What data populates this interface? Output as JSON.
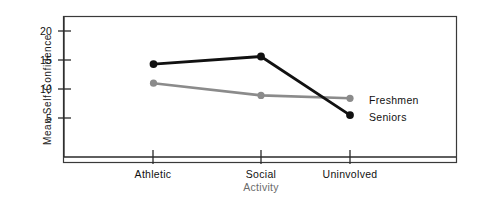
{
  "chart_data": {
    "type": "line",
    "title": "",
    "subtitle": "",
    "xlabel": "Activity",
    "ylabel": "Mean Self-Confidence",
    "categories": [
      "Athletic",
      "Social",
      "Uninvolved"
    ],
    "yticks": [
      "5",
      "10",
      "15",
      "20"
    ],
    "ytick_values": [
      5,
      10,
      15,
      20
    ],
    "ylim": [
      0,
      22
    ],
    "grid": false,
    "legend_position": "inline-right-end-of-line",
    "series": [
      {
        "name": "Seniors",
        "color": "#111111",
        "marker": "filled-circle",
        "values": [
          14.3,
          15.6,
          5.5
        ]
      },
      {
        "name": "Freshmen",
        "color": "#8b8b8b",
        "marker": "filled-circle",
        "values": [
          11.0,
          8.9,
          8.4
        ]
      }
    ],
    "annotations": [
      {
        "text": "Freshmen",
        "series": "Freshmen"
      },
      {
        "text": "Seniors",
        "series": "Seniors"
      }
    ]
  },
  "axes": {
    "y_title": "Mean Self-Confidence",
    "x_title": "Activity",
    "y_tick_0": "5",
    "y_tick_1": "10",
    "y_tick_2": "15",
    "y_tick_3": "20",
    "x_tick_0": "Athletic",
    "x_tick_1": "Social",
    "x_tick_2": "Uninvolved"
  },
  "legend": {
    "freshmen_label": "Freshmen",
    "seniors_label": "Seniors"
  },
  "colors": {
    "seniors": "#111111",
    "freshmen": "#8b8b8b",
    "frame": "#3a3a3a",
    "axis": "#2a2a2a",
    "axis_title_muted": "#6b6b6b"
  }
}
